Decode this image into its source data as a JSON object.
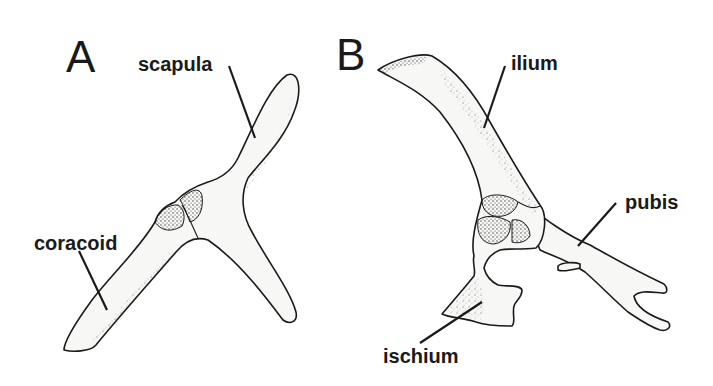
{
  "figure": {
    "panels": [
      {
        "letter": "A",
        "subject": "pectoral girdle",
        "labels": {
          "scapula": "scapula",
          "coracoid": "coracoid"
        }
      },
      {
        "letter": "B",
        "subject": "pelvic girdle",
        "labels": {
          "ilium": "ilium",
          "pubis": "pubis",
          "ischium": "ischium"
        }
      }
    ],
    "colors": {
      "background": "#ffffff",
      "ink": "#1a1a1a",
      "bone_fill": "#f7f7f5"
    }
  }
}
